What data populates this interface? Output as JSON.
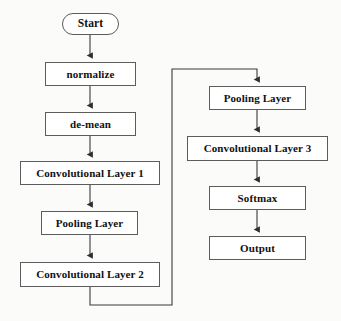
{
  "diagram": {
    "background_color": "#fbfbfa",
    "line_color": "#3a3a3a",
    "box_border_color": "#5c5c5c",
    "box_fill_color": "#ffffff",
    "text_color": "#111111",
    "nodes": [
      {
        "id": "start",
        "label": "Start",
        "shape": "terminal",
        "x": 62,
        "y": 13,
        "w": 57,
        "h": 22,
        "font_size": 11.5,
        "column": "left"
      },
      {
        "id": "normalize",
        "label": "normalize",
        "shape": "rect",
        "x": 45,
        "y": 62,
        "w": 91,
        "h": 24,
        "font_size": 11,
        "column": "left"
      },
      {
        "id": "de-mean",
        "label": "de-mean",
        "shape": "rect",
        "x": 45,
        "y": 112,
        "w": 91,
        "h": 24,
        "font_size": 11,
        "column": "left"
      },
      {
        "id": "conv1",
        "label": "Convolutional Layer 1",
        "shape": "rect",
        "x": 20,
        "y": 161,
        "w": 140,
        "h": 24,
        "font_size": 11,
        "column": "left"
      },
      {
        "id": "pool1",
        "label": "Pooling Layer",
        "shape": "rect",
        "x": 41,
        "y": 211,
        "w": 97,
        "h": 24,
        "font_size": 11,
        "column": "left"
      },
      {
        "id": "conv2",
        "label": "Convolutional Layer 2",
        "shape": "rect",
        "x": 20,
        "y": 262,
        "w": 140,
        "h": 25,
        "font_size": 11,
        "column": "left"
      },
      {
        "id": "pool2",
        "label": "Pooling Layer",
        "shape": "rect",
        "x": 209,
        "y": 86,
        "w": 97,
        "h": 24,
        "font_size": 11,
        "column": "right"
      },
      {
        "id": "conv3",
        "label": "Convolutional Layer 3",
        "shape": "rect",
        "x": 187,
        "y": 136,
        "w": 141,
        "h": 25,
        "font_size": 11,
        "column": "right"
      },
      {
        "id": "softmax",
        "label": "Softmax",
        "shape": "rect",
        "x": 209,
        "y": 186,
        "w": 97,
        "h": 24,
        "font_size": 11,
        "column": "right"
      },
      {
        "id": "output",
        "label": "Output",
        "shape": "rect",
        "x": 209,
        "y": 236,
        "w": 97,
        "h": 24,
        "font_size": 11,
        "column": "right"
      }
    ],
    "edges": [
      {
        "id": "edge-start-normalize",
        "from": "start",
        "to": "normalize",
        "kind": "straight-down",
        "arrow": true
      },
      {
        "id": "edge-normalize-demean",
        "from": "normalize",
        "to": "de-mean",
        "kind": "straight-down",
        "arrow": true
      },
      {
        "id": "edge-demean-conv1",
        "from": "de-mean",
        "to": "conv1",
        "kind": "straight-down",
        "arrow": true
      },
      {
        "id": "edge-conv1-pool1",
        "from": "conv1",
        "to": "pool1",
        "kind": "straight-down",
        "arrow": true
      },
      {
        "id": "edge-pool1-conv2",
        "from": "pool1",
        "to": "conv2",
        "kind": "straight-down",
        "arrow": true
      },
      {
        "id": "edge-conv2-pool2",
        "from": "conv2",
        "to": "pool2",
        "kind": "orthogonal-wrap",
        "arrow": true
      },
      {
        "id": "edge-pool2-conv3",
        "from": "pool2",
        "to": "conv3",
        "kind": "straight-down",
        "arrow": true
      },
      {
        "id": "edge-conv3-softmax",
        "from": "conv3",
        "to": "softmax",
        "kind": "straight-down",
        "arrow": true
      },
      {
        "id": "edge-softmax-output",
        "from": "softmax",
        "to": "output",
        "kind": "straight-down",
        "arrow": true
      }
    ],
    "geometry": {
      "left_column_center_x": 90,
      "right_column_center_x": 257,
      "wrap_bottom_y": 305,
      "wrap_left_x": 172,
      "wrap_top_y": 69
    }
  }
}
